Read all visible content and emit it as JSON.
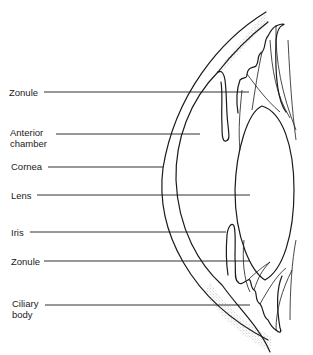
{
  "diagram": {
    "title": "",
    "colors": {
      "line": "#1a1a1a",
      "text": "#222222",
      "stipple": "#9a9a9a",
      "background": "#ffffff"
    },
    "labels": [
      {
        "id": "zonule-top",
        "text": "Zonule",
        "x": 9,
        "y": 88,
        "line_x1": 44,
        "line_x2": 249,
        "line_y": 92
      },
      {
        "id": "anterior-chamber",
        "text": "Anterior\nchamber",
        "x": 10,
        "y": 126,
        "line_x1": 56,
        "line_x2": 200,
        "line_y": 134
      },
      {
        "id": "cornea",
        "text": "Cornea",
        "x": 11,
        "y": 162,
        "line_x1": 48,
        "line_x2": 163,
        "line_y": 167
      },
      {
        "id": "lens",
        "text": "Lens",
        "x": 11,
        "y": 191,
        "line_x1": 37,
        "line_x2": 250,
        "line_y": 195
      },
      {
        "id": "iris",
        "text": "Iris",
        "x": 11,
        "y": 228,
        "line_x1": 30,
        "line_x2": 226,
        "line_y": 232
      },
      {
        "id": "zonule-bottom",
        "text": "Zonule",
        "x": 11,
        "y": 257,
        "line_x1": 44,
        "line_x2": 250,
        "line_y": 261
      },
      {
        "id": "ciliary-body",
        "text": "Ciliary\nbody",
        "x": 12,
        "y": 300,
        "line_x1": 45,
        "line_x2": 250,
        "line_y": 305
      }
    ]
  }
}
